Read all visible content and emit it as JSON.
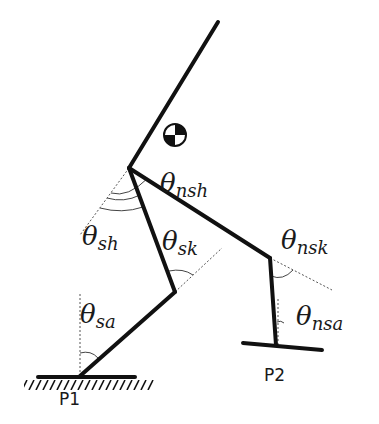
{
  "diagram": {
    "type": "biped-walker-kinematics",
    "colors": {
      "link": "#111111",
      "guide": "#555555",
      "background": "#ffffff"
    },
    "joints": {
      "torso_top": [
        218,
        22
      ],
      "hip": [
        129,
        168
      ],
      "stance_knee": [
        175,
        292
      ],
      "stance_ankle": [
        80,
        376
      ],
      "swing_knee": [
        270,
        258
      ],
      "swing_ankle": [
        276,
        345
      ]
    },
    "center_of_mass": {
      "cx": 175,
      "cy": 135,
      "r": 11
    },
    "labels": {
      "theta_sym": "θ",
      "nsh": "nsh",
      "sh": "sh",
      "sk": "sk",
      "nsk": "nsk",
      "sa": "sa",
      "nsa": "nsa",
      "p1": "P1",
      "p2": "P2"
    }
  }
}
